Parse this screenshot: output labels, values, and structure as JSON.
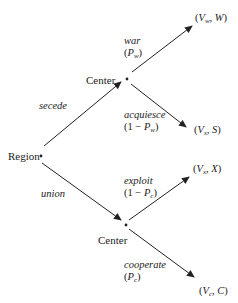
{
  "diagram": {
    "type": "game-tree",
    "nodes": {
      "root": {
        "label": "Region"
      },
      "center_upper": {
        "label": "Center"
      },
      "center_lower": {
        "label": "Center"
      }
    },
    "branches": {
      "secede": {
        "label": "secede"
      },
      "union": {
        "label": "union"
      },
      "war": {
        "label": "war",
        "prob_open": "(",
        "prob_var": "P",
        "prob_sub": "w",
        "prob_close": ")"
      },
      "acquiesce": {
        "label": "acquiesce",
        "prob_open": "(1 − ",
        "prob_var": "P",
        "prob_sub": "w",
        "prob_close": ")"
      },
      "exploit": {
        "label": "exploit",
        "prob_open": "(1 − ",
        "prob_var": "P",
        "prob_sub": "c",
        "prob_close": ")"
      },
      "cooperate": {
        "label": "cooperate",
        "prob_open": "(",
        "prob_var": "P",
        "prob_sub": "c",
        "prob_close": ")"
      }
    },
    "payoffs": {
      "war": {
        "open": "(",
        "v": "V",
        "sub": "w",
        "sep": ", ",
        "x": "W",
        "close": ")"
      },
      "acquiesce": {
        "open": "(",
        "v": "V",
        "sub": "s",
        "sep": ", ",
        "x": "S",
        "close": ")"
      },
      "exploit": {
        "open": "(",
        "v": "V",
        "sub": "x",
        "sep": ", ",
        "x": "X",
        "close": ")"
      },
      "cooperate": {
        "open": "(",
        "v": "V",
        "sub": "c",
        "sep": ", ",
        "x": "C",
        "close": ")"
      }
    },
    "colors": {
      "line": "#222222",
      "background": "#ffffff"
    }
  }
}
